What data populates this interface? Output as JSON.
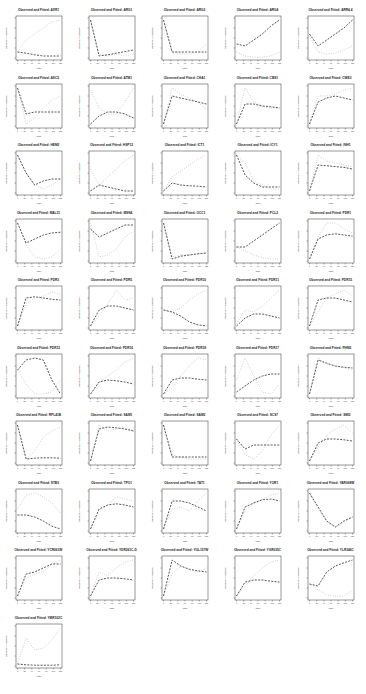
{
  "figure": {
    "title_prefix": "Observed and Fitted: ",
    "xlabel": "time",
    "ylabel": "Relative Abundance",
    "x_ticks": [
      0,
      20,
      40,
      60,
      80,
      100,
      120
    ],
    "observed_style": "dotted light gray",
    "fitted_style": "dashed dark gray"
  },
  "chart_data": {
    "type": "line",
    "layout": {
      "columns": 5,
      "rows": 10,
      "panels": 46
    },
    "xlabel": "time",
    "ylabel": "Relative Abundance",
    "x": [
      0,
      24,
      48,
      72,
      96,
      120
    ],
    "legend": [],
    "series_names": [
      "Observed",
      "Fitted"
    ],
    "panels": [
      {
        "title": "Observed and Fitted: AXR1",
        "observed": [
          0.15,
          0.45,
          0.6,
          0.75,
          0.9,
          0.95
        ],
        "fitted": [
          0.15,
          0.12,
          0.08,
          0.05,
          0.05,
          0.05
        ]
      },
      {
        "title": "Observed and Fitted: ARG1",
        "observed": [
          0.95,
          0.1,
          0.05,
          0.1,
          0.05,
          0.1
        ],
        "fitted": [
          0.95,
          0.05,
          0.08,
          0.12,
          0.16,
          0.2
        ]
      },
      {
        "title": "Observed and Fitted: ARG2",
        "observed": [
          0.95,
          0.15,
          0.1,
          0.1,
          0.15,
          0.35
        ],
        "fitted": [
          0.95,
          0.15,
          0.15,
          0.15,
          0.15,
          0.15
        ]
      },
      {
        "title": "Observed and Fitted: ARG4",
        "observed": [
          0.15,
          0.05,
          0.02,
          0.02,
          0.05,
          0.15
        ],
        "fitted": [
          0.35,
          0.3,
          0.45,
          0.6,
          0.8,
          0.95
        ]
      },
      {
        "title": "Observed and Fitted: ARR4.4",
        "observed": [
          0.55,
          0.15,
          0.1,
          0.12,
          0.2,
          0.3
        ],
        "fitted": [
          0.6,
          0.3,
          0.45,
          0.6,
          0.75,
          0.95
        ]
      },
      {
        "title": "Observed and Fitted: ASC5",
        "observed": [
          0.95,
          0.05,
          0.2,
          0.45,
          0.65,
          0.75
        ],
        "fitted": [
          0.95,
          0.3,
          0.35,
          0.35,
          0.35,
          0.35
        ]
      },
      {
        "title": "Observed and Fitted: ATM1",
        "observed": [
          0.9,
          0.45,
          0.3,
          0.3,
          0.6,
          0.95
        ],
        "fitted": [
          0.05,
          0.25,
          0.35,
          0.35,
          0.3,
          0.2
        ]
      },
      {
        "title": "Observed and Fitted: CHA1",
        "observed": [
          0.05,
          0.95,
          0.8,
          0.7,
          0.6,
          0.4
        ],
        "fitted": [
          0.05,
          0.75,
          0.7,
          0.65,
          0.6,
          0.55
        ]
      },
      {
        "title": "Observed and Fitted: CBS1",
        "observed": [
          0.05,
          0.95,
          0.6,
          0.5,
          0.45,
          0.45
        ],
        "fitted": [
          0.05,
          0.55,
          0.55,
          0.5,
          0.48,
          0.45
        ]
      },
      {
        "title": "Observed and Fitted: CWE2",
        "observed": [
          0.05,
          0.75,
          0.75,
          0.8,
          0.9,
          0.95
        ],
        "fitted": [
          0.05,
          0.6,
          0.7,
          0.75,
          0.7,
          0.65
        ]
      },
      {
        "title": "Observed and Fitted: HEM2",
        "observed": [
          0.95,
          0.5,
          0.2,
          0.1,
          0.2,
          0.35
        ],
        "fitted": [
          0.95,
          0.5,
          0.2,
          0.3,
          0.35,
          0.35
        ]
      },
      {
        "title": "Observed and Fitted: HSP12",
        "observed": [
          0.6,
          0.2,
          0.4,
          0.6,
          0.8,
          0.95
        ],
        "fitted": [
          0.05,
          0.2,
          0.15,
          0.1,
          0.05,
          0.05
        ]
      },
      {
        "title": "Observed and Fitted: ICT1",
        "observed": [
          0.05,
          0.4,
          0.55,
          0.7,
          0.85,
          0.95
        ],
        "fitted": [
          0.05,
          0.25,
          0.2,
          0.18,
          0.17,
          0.15
        ]
      },
      {
        "title": "Observed and Fitted: ICY1",
        "observed": [
          0.95,
          0.75,
          0.3,
          0.2,
          0.1,
          0.1
        ],
        "fitted": [
          0.95,
          0.45,
          0.25,
          0.15,
          0.15,
          0.15
        ]
      },
      {
        "title": "Observed and Fitted: INH1",
        "observed": [
          0.05,
          0.95,
          0.8,
          0.75,
          0.7,
          0.65
        ],
        "fitted": [
          0.05,
          0.7,
          0.68,
          0.66,
          0.64,
          0.6
        ]
      },
      {
        "title": "Observed and Fitted: MAL31",
        "observed": [
          0.95,
          0.4,
          0.1,
          0.05,
          0.1,
          0.3
        ],
        "fitted": [
          0.95,
          0.45,
          0.55,
          0.65,
          0.7,
          0.72
        ]
      },
      {
        "title": "Observed and Fitted: MSN4",
        "observed": [
          0.95,
          0.1,
          0.15,
          0.3,
          0.6,
          0.75
        ],
        "fitted": [
          0.8,
          0.6,
          0.7,
          0.8,
          0.9,
          0.9
        ]
      },
      {
        "title": "Observed and Fitted: OCC1",
        "observed": [
          0.95,
          0.1,
          0.15,
          0.15,
          0.18,
          0.2
        ],
        "fitted": [
          0.95,
          0.05,
          0.12,
          0.15,
          0.18,
          0.2
        ]
      },
      {
        "title": "Observed and Fitted: PCL2",
        "observed": [
          0.35,
          0.25,
          0.15,
          0.08,
          0.05,
          0.05
        ],
        "fitted": [
          0.35,
          0.35,
          0.5,
          0.65,
          0.8,
          0.95
        ]
      },
      {
        "title": "Observed and Fitted: PDR1",
        "observed": [
          0.05,
          0.6,
          0.95,
          0.95,
          0.8,
          0.7
        ],
        "fitted": [
          0.05,
          0.55,
          0.65,
          0.68,
          0.65,
          0.62
        ]
      },
      {
        "title": "Observed and Fitted: PDR3",
        "observed": [
          0.05,
          0.6,
          0.75,
          0.8,
          0.9,
          0.85
        ],
        "fitted": [
          0.05,
          0.75,
          0.78,
          0.75,
          0.72,
          0.7
        ]
      },
      {
        "title": "Observed and Fitted: PDR5",
        "observed": [
          0.05,
          0.3,
          0.6,
          0.95,
          0.7,
          0.75
        ],
        "fitted": [
          0.05,
          0.45,
          0.55,
          0.55,
          0.5,
          0.45
        ]
      },
      {
        "title": "Observed and Fitted: PDR10",
        "observed": [
          0.45,
          0.4,
          0.5,
          0.7,
          0.85,
          0.95
        ],
        "fitted": [
          0.45,
          0.4,
          0.3,
          0.15,
          0.08,
          0.05
        ]
      },
      {
        "title": "Observed and Fitted: PDR11",
        "observed": [
          0.1,
          0.45,
          0.4,
          0.55,
          0.75,
          0.95
        ],
        "fitted": [
          0.05,
          0.25,
          0.35,
          0.35,
          0.3,
          0.25
        ]
      },
      {
        "title": "Observed and Fitted: PDR15",
        "observed": [
          0.05,
          0.4,
          0.75,
          0.85,
          0.95,
          0.8
        ],
        "fitted": [
          0.05,
          0.7,
          0.75,
          0.75,
          0.7,
          0.65
        ]
      },
      {
        "title": "Observed and Fitted: PDR12",
        "observed": [
          0.65,
          0.3,
          0.05,
          0.05,
          0.1,
          0.4
        ],
        "fitted": [
          0.65,
          0.9,
          0.95,
          0.9,
          0.4,
          0.05
        ]
      },
      {
        "title": "Observed and Fitted: PDR16",
        "observed": [
          0.05,
          0.35,
          0.5,
          0.65,
          0.85,
          0.95
        ],
        "fitted": [
          0.05,
          0.35,
          0.4,
          0.38,
          0.35,
          0.3
        ]
      },
      {
        "title": "Observed and Fitted: PDR18",
        "observed": [
          0.05,
          0.2,
          0.5,
          0.75,
          0.95,
          0.9
        ],
        "fitted": [
          0.05,
          0.4,
          0.45,
          0.45,
          0.42,
          0.4
        ]
      },
      {
        "title": "Observed and Fitted: PDR17",
        "observed": [
          0.4,
          0.95,
          0.5,
          0.1,
          0.05,
          0.3
        ],
        "fitted": [
          0.1,
          0.25,
          0.4,
          0.5,
          0.55,
          0.55
        ]
      },
      {
        "title": "Observed and Fitted: PHM3",
        "observed": [
          0.05,
          0.95,
          0.8,
          0.75,
          0.7,
          0.65
        ],
        "fitted": [
          0.05,
          0.9,
          0.82,
          0.75,
          0.72,
          0.7
        ]
      },
      {
        "title": "Observed and Fitted: RPL41B",
        "observed": [
          0.95,
          0.1,
          0.3,
          0.65,
          0.8,
          0.9
        ],
        "fitted": [
          0.95,
          0.1,
          0.12,
          0.13,
          0.13,
          0.12
        ]
      },
      {
        "title": "Observed and Fitted: SAM1",
        "observed": [
          0.05,
          0.95,
          0.8,
          0.85,
          0.9,
          0.8
        ],
        "fitted": [
          0.05,
          0.85,
          0.9,
          0.88,
          0.85,
          0.8
        ]
      },
      {
        "title": "Observed and Fitted: SAM2",
        "observed": [
          0.95,
          0.2,
          0.15,
          0.1,
          0.1,
          0.1
        ],
        "fitted": [
          0.95,
          0.15,
          0.15,
          0.15,
          0.15,
          0.15
        ]
      },
      {
        "title": "Observed and Fitted: SCS7",
        "observed": [
          0.6,
          0.2,
          0.1,
          0.3,
          0.7,
          0.95
        ],
        "fitted": [
          0.6,
          0.35,
          0.45,
          0.45,
          0.45,
          0.45
        ]
      },
      {
        "title": "Observed and Fitted: SMI2",
        "observed": [
          0.05,
          0.4,
          0.7,
          0.85,
          0.95,
          0.75
        ],
        "fitted": [
          0.05,
          0.5,
          0.6,
          0.6,
          0.58,
          0.55
        ]
      },
      {
        "title": "Observed and Fitted: STB5",
        "observed": [
          0.55,
          0.9,
          0.95,
          0.85,
          0.7,
          0.45
        ],
        "fitted": [
          0.4,
          0.4,
          0.35,
          0.25,
          0.12,
          0.05
        ]
      },
      {
        "title": "Observed and Fitted: TPO1",
        "observed": [
          0.05,
          0.5,
          0.65,
          0.85,
          0.8,
          0.75
        ],
        "fitted": [
          0.05,
          0.55,
          0.65,
          0.68,
          0.65,
          0.6
        ]
      },
      {
        "title": "Observed and Fitted: TAT1",
        "observed": [
          0.05,
          0.55,
          0.6,
          0.5,
          0.75,
          0.95
        ],
        "fitted": [
          0.05,
          0.75,
          0.75,
          0.7,
          0.6,
          0.5
        ]
      },
      {
        "title": "Observed and Fitted: YOR1",
        "observed": [
          0.05,
          0.5,
          0.7,
          0.8,
          0.9,
          0.95
        ],
        "fitted": [
          0.05,
          0.6,
          0.7,
          0.78,
          0.8,
          0.75
        ]
      },
      {
        "title": "Observed and Fitted: YAR068W",
        "observed": [
          0.95,
          0.55,
          0.25,
          0.1,
          0.2,
          0.35
        ],
        "fitted": [
          0.95,
          0.6,
          0.25,
          0.1,
          0.25,
          0.35
        ]
      },
      {
        "title": "Observed and Fitted: YCR061W",
        "observed": [
          0.05,
          0.5,
          0.6,
          0.65,
          0.85,
          0.95
        ],
        "fitted": [
          0.05,
          0.6,
          0.65,
          0.75,
          0.85,
          0.85
        ]
      },
      {
        "title": "Observed and Fitted: YDR261C-D",
        "observed": [
          0.05,
          0.65,
          0.55,
          0.75,
          0.9,
          0.95
        ],
        "fitted": [
          0.05,
          0.45,
          0.5,
          0.5,
          0.48,
          0.45
        ]
      },
      {
        "title": "Observed and Fitted: YGL157W",
        "observed": [
          0.05,
          0.6,
          0.8,
          0.7,
          0.65,
          0.75
        ],
        "fitted": [
          0.05,
          0.95,
          0.8,
          0.72,
          0.68,
          0.65
        ]
      },
      {
        "title": "Observed and Fitted: YGR035C",
        "observed": [
          0.05,
          0.3,
          0.55,
          0.75,
          0.9,
          0.95
        ],
        "fitted": [
          0.05,
          0.4,
          0.45,
          0.45,
          0.42,
          0.4
        ]
      },
      {
        "title": "Observed and Fitted: YLR346C",
        "observed": [
          0.35,
          0.2,
          0.08,
          0.05,
          0.05,
          0.2
        ],
        "fitted": [
          0.35,
          0.3,
          0.65,
          0.8,
          0.88,
          0.95
        ]
      },
      {
        "title": "Observed and Fitted: YMR102C",
        "observed": [
          0.05,
          0.7,
          0.4,
          0.45,
          0.65,
          0.95
        ],
        "fitted": [
          0.05,
          0.03,
          0.02,
          0.02,
          0.02,
          0.03
        ]
      }
    ]
  }
}
